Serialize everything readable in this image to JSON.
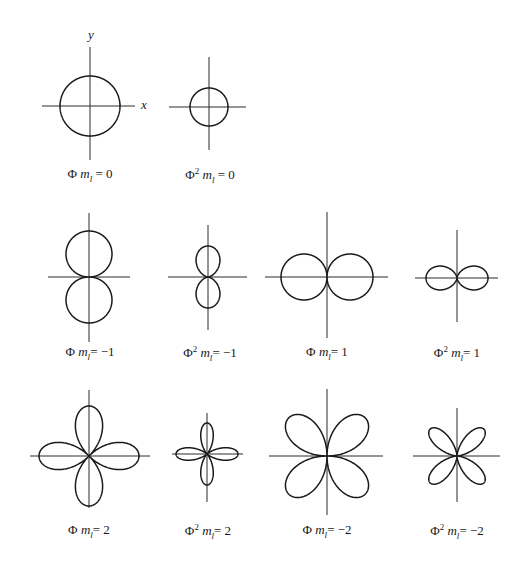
{
  "figure": {
    "axis_labels": {
      "x": "x",
      "y": "y"
    },
    "plots": [
      {
        "id": "phi-m0",
        "symbol": "Φ",
        "power": "",
        "ml_sym": "m",
        "ml_sub": "l",
        "eq": "= 0",
        "cx": 90,
        "cy": 106,
        "fn": "const",
        "r": 30,
        "axis": {
          "x1": 42,
          "x2": 135,
          "y1": 47,
          "y2": 160
        },
        "label_x": 90,
        "label_y": 166
      },
      {
        "id": "phi2-m0",
        "symbol": "Φ",
        "power": "2",
        "ml_sym": "m",
        "ml_sub": "l",
        "eq": "= 0",
        "cx": 209,
        "cy": 107,
        "fn": "const",
        "r": 19,
        "axis": {
          "x1": 169,
          "x2": 246,
          "y1": 57,
          "y2": 150
        },
        "label_x": 210,
        "label_y": 166
      },
      {
        "id": "phi-m-1",
        "symbol": "Φ",
        "power": "",
        "ml_sym": "m",
        "ml_sub": "l",
        "eq": "= −1",
        "cx": 89,
        "cy": 277,
        "fn": "abs_sin",
        "r": 46,
        "axis": {
          "x1": 48,
          "x2": 130,
          "y1": 213,
          "y2": 342
        },
        "label_x": 90,
        "label_y": 344
      },
      {
        "id": "phi2-m-1",
        "symbol": "Φ",
        "power": "2",
        "ml_sym": "m",
        "ml_sub": "l",
        "eq": "= −1",
        "cx": 208,
        "cy": 277,
        "fn": "sin2",
        "r": 31,
        "axis": {
          "x1": 168,
          "x2": 247,
          "y1": 225,
          "y2": 330
        },
        "label_x": 210,
        "label_y": 344
      },
      {
        "id": "phi-m1",
        "symbol": "Φ",
        "power": "",
        "ml_sym": "m",
        "ml_sub": "l",
        "eq": "= 1",
        "cx": 327,
        "cy": 277,
        "fn": "abs_cos",
        "r": 46,
        "axis": {
          "x1": 265,
          "x2": 388,
          "y1": 212,
          "y2": 338
        },
        "label_x": 327,
        "label_y": 344
      },
      {
        "id": "phi2-m1",
        "symbol": "Φ",
        "power": "2",
        "ml_sym": "m",
        "ml_sub": "l",
        "eq": "= 1",
        "cx": 457,
        "cy": 278,
        "fn": "cos2",
        "r": 31,
        "axis": {
          "x1": 415,
          "x2": 498,
          "y1": 230,
          "y2": 322
        },
        "label_x": 457,
        "label_y": 344
      },
      {
        "id": "phi-m2",
        "symbol": "Φ",
        "power": "",
        "ml_sym": "m",
        "ml_sub": "l",
        "eq": "= 2",
        "cx": 89,
        "cy": 456,
        "fn": "abs_cos2",
        "r": 50,
        "axis": {
          "x1": 30,
          "x2": 150,
          "y1": 390,
          "y2": 508
        },
        "label_x": 89,
        "label_y": 522
      },
      {
        "id": "phi2-m2",
        "symbol": "Φ",
        "power": "2",
        "ml_sym": "m",
        "ml_sub": "l",
        "eq": "= 2",
        "cx": 207,
        "cy": 454,
        "fn": "cos2_2",
        "r": 31,
        "axis": {
          "x1": 172,
          "x2": 243,
          "y1": 413,
          "y2": 502
        },
        "label_x": 208,
        "label_y": 522
      },
      {
        "id": "phi-m-2",
        "symbol": "Φ",
        "power": "",
        "ml_sym": "m",
        "ml_sub": "l",
        "eq": "= −2",
        "cx": 327,
        "cy": 456,
        "fn": "abs_sin2",
        "r": 54,
        "axis": {
          "x1": 269,
          "x2": 383,
          "y1": 389,
          "y2": 515
        },
        "label_x": 327,
        "label_y": 522
      },
      {
        "id": "phi2-m-2",
        "symbol": "Φ",
        "power": "2",
        "ml_sym": "m",
        "ml_sub": "l",
        "eq": "= −2",
        "cx": 457,
        "cy": 456,
        "fn": "sin2_2",
        "r": 38,
        "axis": {
          "x1": 413,
          "x2": 500,
          "y1": 408,
          "y2": 502
        },
        "label_x": 457,
        "label_y": 522
      }
    ]
  },
  "labels": {
    "phi_m0": {
      "sym": "Φ",
      "m": "m",
      "sub": "l",
      "eq": " = 0"
    },
    "phi2_m0": {
      "sym": "Φ",
      "sup": "2",
      "m": "m",
      "sub": "l",
      "eq": " = 0"
    },
    "phi_m_1": {
      "sym": "Φ",
      "m": "m",
      "sub": "l",
      "eq": "= −1"
    },
    "phi2_m_1": {
      "sym": "Φ",
      "sup": "2",
      "m": "m",
      "sub": "l",
      "eq": "= −1"
    },
    "phi_m1": {
      "sym": "Φ",
      "m": "m",
      "sub": "l",
      "eq": "= 1"
    },
    "phi2_m1": {
      "sym": "Φ",
      "sup": "2",
      "m": "m",
      "sub": "l",
      "eq": "= 1"
    },
    "phi_m2": {
      "sym": "Φ",
      "m": "m",
      "sub": "l",
      "eq": "= 2"
    },
    "phi2_m2": {
      "sym": "Φ",
      "sup": "2",
      "m": "m",
      "sub": "l",
      "eq": "= 2"
    },
    "phi_m_2": {
      "sym": "Φ",
      "m": "m",
      "sub": "l",
      "eq": "= −2"
    },
    "phi2_m_2": {
      "sym": "Φ",
      "sup": "2",
      "m": "m",
      "sub": "l",
      "eq": "= −2"
    }
  },
  "colors": {
    "ink": "#1a1a1a",
    "background": "#ffffff"
  }
}
